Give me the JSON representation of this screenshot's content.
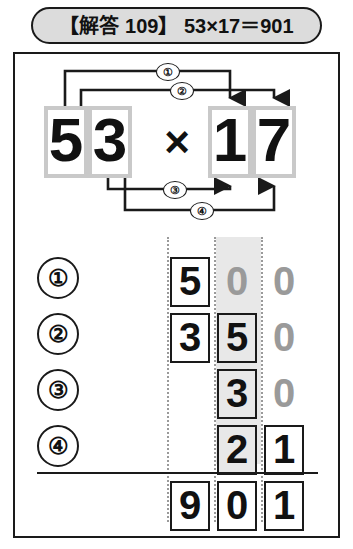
{
  "header": {
    "title": "【解答 109】 53×17＝901"
  },
  "equation": {
    "multiplicand": {
      "tens": "5",
      "ones": "3"
    },
    "operator": "×",
    "multiplier": {
      "tens": "1",
      "ones": "7"
    },
    "connectors": [
      {
        "label": "①",
        "from": "multiplicand-tens",
        "to": "multiplier-tens"
      },
      {
        "label": "②",
        "from": "multiplicand-tens",
        "to": "multiplier-ones"
      },
      {
        "label": "③",
        "from": "multiplicand-ones",
        "to": "multiplier-tens"
      },
      {
        "label": "④",
        "from": "multiplicand-ones",
        "to": "multiplier-ones"
      }
    ]
  },
  "grid": {
    "carry": "1",
    "row_labels": [
      "①",
      "②",
      "③",
      "④"
    ],
    "rows": [
      {
        "label": "①",
        "cells": [
          {
            "value": "5",
            "boxed": true,
            "ink": "dark",
            "shaded": false
          },
          {
            "value": "0",
            "boxed": false,
            "ink": "gray",
            "shaded": true
          },
          {
            "value": "0",
            "boxed": false,
            "ink": "gray",
            "shaded": false
          }
        ]
      },
      {
        "label": "②",
        "cells": [
          {
            "value": "3",
            "boxed": true,
            "ink": "dark",
            "shaded": false
          },
          {
            "value": "5",
            "boxed": true,
            "ink": "dark",
            "shaded": true
          },
          {
            "value": "0",
            "boxed": false,
            "ink": "gray",
            "shaded": false
          }
        ]
      },
      {
        "label": "③",
        "cells": [
          {
            "value": "",
            "boxed": false,
            "ink": "dark",
            "shaded": false
          },
          {
            "value": "3",
            "boxed": true,
            "ink": "dark",
            "shaded": true
          },
          {
            "value": "0",
            "boxed": false,
            "ink": "gray",
            "shaded": false
          }
        ]
      },
      {
        "label": "④",
        "cells": [
          {
            "value": "",
            "boxed": false,
            "ink": "dark",
            "shaded": false
          },
          {
            "value": "2",
            "boxed": true,
            "ink": "dark",
            "shaded": true
          },
          {
            "value": "1",
            "boxed": true,
            "ink": "dark",
            "shaded": false
          }
        ]
      }
    ],
    "result": {
      "cells": [
        {
          "value": "9",
          "boxed": true,
          "ink": "dark"
        },
        {
          "value": "0",
          "boxed": true,
          "ink": "dark"
        },
        {
          "value": "1",
          "boxed": true,
          "ink": "dark"
        }
      ]
    }
  },
  "colors": {
    "ink": "#111111",
    "gray_ink": "#9a9a9a",
    "box_gray": "#c9c9c9",
    "shade": "#e8e8e8",
    "header_fill": "#dcdcdc"
  }
}
